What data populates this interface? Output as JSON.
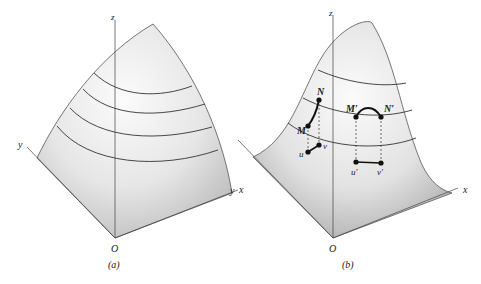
{
  "figure": {
    "panels": [
      {
        "id": "a",
        "caption": "(a)",
        "axes": {
          "x": "x",
          "y": "y",
          "z": "z",
          "origin": "O"
        },
        "description": "Dome-like surface over first quadrant with four horizontal level curves"
      },
      {
        "id": "b",
        "caption": "(b)",
        "axes": {
          "x": "x",
          "y": "y",
          "z": "z",
          "origin": "O"
        },
        "points_on_surface": [
          "M",
          "N",
          "M'",
          "N'"
        ],
        "points_in_plane": [
          "u",
          "v",
          "u'",
          "v'"
        ],
        "description": "Bell-shaped surface with level curves; segment u-v maps to arc M-N, segment u'-v' maps to arc M'-N'"
      }
    ]
  },
  "labels": {
    "a_z": "z",
    "a_y": "y",
    "a_x": "x",
    "a_O": "O",
    "a_cap": "(a)",
    "b_z": "z",
    "b_y": "y",
    "b_x": "x",
    "b_O": "O",
    "b_cap": "(b)",
    "N": "N",
    "M": "M",
    "u": "u",
    "v": "v",
    "Mp": "M′",
    "Np": "N′",
    "up": "u′",
    "vp": "v′"
  },
  "colors": {
    "surface_light": "#f2f2f2",
    "surface_dark": "#a8a8a8",
    "line": "#333333"
  }
}
